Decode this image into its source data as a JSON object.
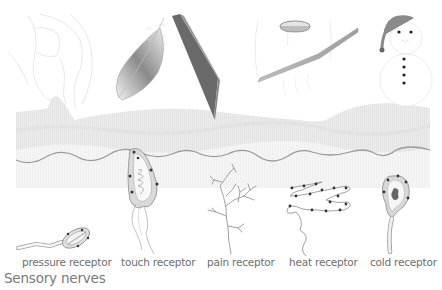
{
  "title": "Sensory nerves",
  "stimuli": [
    {
      "id": "hand",
      "name": "pinching-hand"
    },
    {
      "id": "feather",
      "name": "feather"
    },
    {
      "id": "blade",
      "name": "knife-blade"
    },
    {
      "id": "iron",
      "name": "hot-iron"
    },
    {
      "id": "snowman",
      "name": "snowman"
    }
  ],
  "receptors": [
    {
      "id": "pressure",
      "label": "pressure receptor"
    },
    {
      "id": "touch",
      "label": "touch receptor"
    },
    {
      "id": "pain",
      "label": "pain receptor"
    },
    {
      "id": "heat",
      "label": "heat receptor"
    },
    {
      "id": "cold",
      "label": "cold receptor"
    }
  ],
  "colors": {
    "background": "#ffffff",
    "skin_layer": "#ececec",
    "skin_layer_dark": "#e0e0e0",
    "dermis": "#f5f5f5",
    "boundary_line": "#9a9a9a",
    "receptor_stroke": "#8a8a8a",
    "receptor_dot": "#333333",
    "blade": "#6a6a6a",
    "label_text": "#6e6e6e"
  }
}
